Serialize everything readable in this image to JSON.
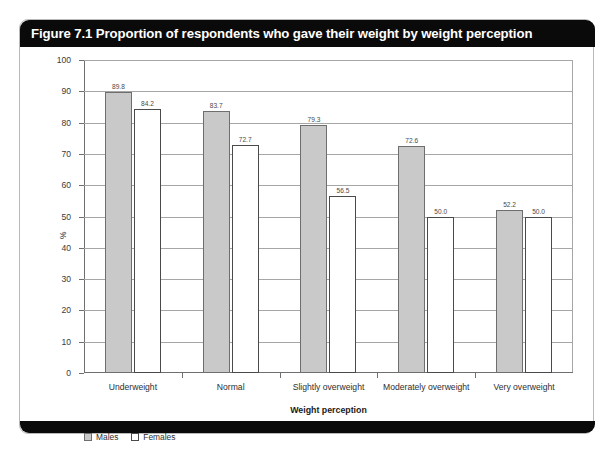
{
  "figure": {
    "title": "Figure 7.1 Proportion of respondents who gave their weight by weight perception"
  },
  "chart_data": {
    "type": "bar",
    "title": "Figure 7.1 Proportion of respondents who gave their weight by weight perception",
    "xlabel": "Weight perception",
    "ylabel": "%",
    "ylim": [
      0,
      100
    ],
    "yticks": [
      0,
      10,
      20,
      30,
      40,
      50,
      60,
      70,
      80,
      90,
      100
    ],
    "grid": true,
    "legend_position": "bottom-left",
    "categories": [
      "Underweight",
      "Normal",
      "Slightly overweight",
      "Moderately overweight",
      "Very overweight"
    ],
    "series": [
      {
        "name": "Males",
        "color": "#c9c9c9",
        "values": [
          89.8,
          83.7,
          79.3,
          72.6,
          52.2
        ],
        "labels": [
          "89.8",
          "83.7",
          "79.3",
          "72.6",
          "52.2"
        ]
      },
      {
        "name": "Females",
        "color": "#ffffff",
        "values": [
          84.2,
          72.7,
          56.5,
          50.0,
          50.0
        ],
        "labels": [
          "84.2",
          "72.7",
          "56.5",
          "50.0",
          "50.0"
        ]
      }
    ]
  }
}
